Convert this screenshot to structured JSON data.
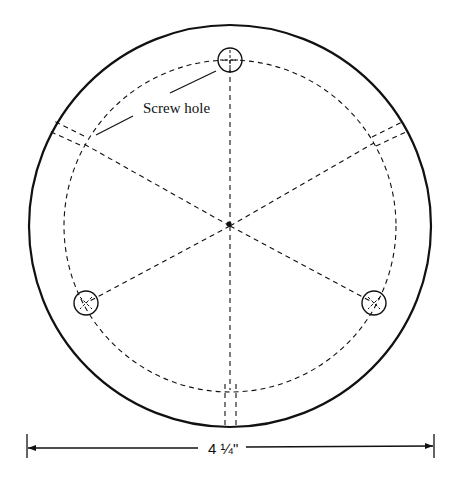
{
  "diagram": {
    "labels": {
      "screw_hole": "Screw hole",
      "diameter": "4 ¼\""
    },
    "colors": {
      "line": "#111111",
      "background": "#ffffff"
    },
    "geometry": {
      "center": [
        230,
        226
      ],
      "outer_radius": 201,
      "bolt_circle_radius": 166,
      "screw_holes": [
        {
          "cx": 230,
          "cy": 60
        },
        {
          "cx": 86,
          "cy": 303
        },
        {
          "cx": 374,
          "cy": 303
        }
      ],
      "channels_deg": [
        150,
        30,
        270
      ]
    }
  }
}
